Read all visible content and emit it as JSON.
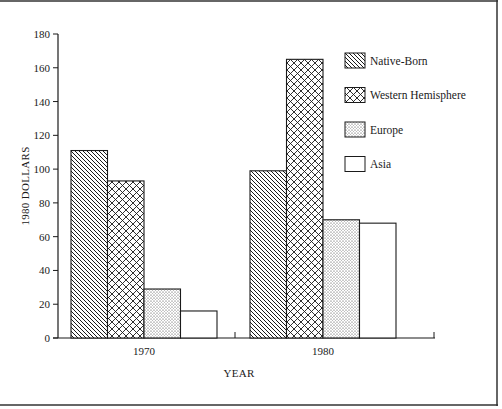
{
  "chart_data": {
    "type": "bar",
    "title": "",
    "xlabel": "YEAR",
    "ylabel": "1980 DOLLARS",
    "ylim": [
      0,
      180
    ],
    "yticks": [
      0,
      20,
      40,
      60,
      80,
      100,
      120,
      140,
      160,
      180
    ],
    "grid": false,
    "legend_position": "top-right",
    "categories": [
      "1970",
      "1980"
    ],
    "series": [
      {
        "name": "Native-Born",
        "pattern": "diagonal-hatch",
        "values": [
          111,
          99
        ]
      },
      {
        "name": "Western Hemisphere",
        "pattern": "crosshatch",
        "values": [
          93,
          165
        ]
      },
      {
        "name": "Europe",
        "pattern": "dots",
        "values": [
          29,
          70
        ]
      },
      {
        "name": "Asia",
        "pattern": "none",
        "values": [
          16,
          68
        ]
      }
    ],
    "colors": {
      "ink": "#1a1a1a",
      "background": "#ffffff"
    }
  }
}
